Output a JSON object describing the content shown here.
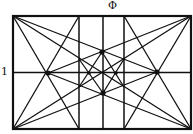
{
  "labels": {
    "width": "Φ",
    "height": "1"
  },
  "colors": {
    "line": "#111111",
    "background": "#ffffff"
  },
  "geometry": {
    "rect": {
      "x0": 13,
      "y0": 16,
      "x1": 191,
      "y1": 129
    },
    "verticals": [
      79,
      103,
      124
    ],
    "midline_y": 72.5,
    "points": {
      "left_dot": [
        48,
        73
      ],
      "right_dot": [
        157,
        72
      ],
      "top_dot": [
        102,
        52
      ],
      "bottom_dot": [
        103,
        93
      ],
      "inner_left_dot": [
        89,
        73
      ],
      "inner_right_dot": [
        116,
        73
      ]
    }
  }
}
